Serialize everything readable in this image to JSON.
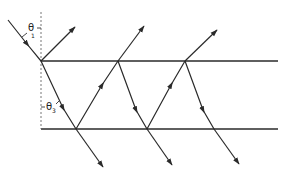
{
  "diagram": {
    "title": "",
    "colors": {
      "line": "#2a2a2a",
      "normal": "#666666",
      "background": "#ffffff"
    },
    "labels": {
      "theta1": {
        "symbol": "θ",
        "subscript": "1"
      },
      "theta3": {
        "symbol": "θ",
        "subscript": "3"
      }
    },
    "surfaces": {
      "top_y": 61,
      "bottom_y": 129,
      "x_start": 41,
      "x_end": 278
    },
    "incident_ray": {
      "from": [
        8,
        20
      ],
      "to": [
        41,
        61
      ]
    },
    "normal_line": {
      "x": 41,
      "y_from": 12,
      "y_to": 129
    },
    "top_points_x": [
      41,
      118,
      185
    ],
    "bottom_points_x": [
      76,
      147,
      214
    ],
    "reflected_up_tips": [
      [
        75,
        27
      ],
      [
        144,
        26
      ],
      [
        217,
        30
      ]
    ],
    "transmitted_down_tips": [
      [
        103,
        167
      ],
      [
        172,
        165
      ],
      [
        239,
        164
      ]
    ]
  }
}
